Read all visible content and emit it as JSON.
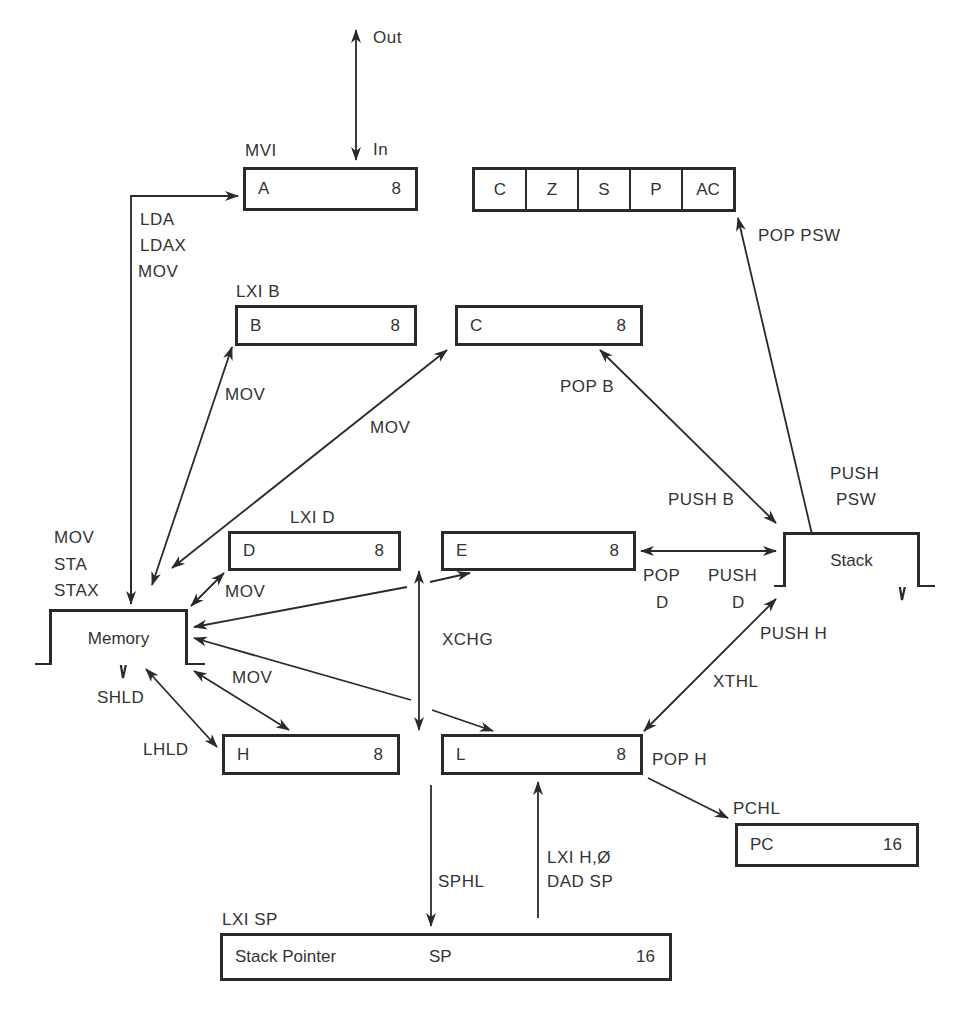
{
  "diagram": {
    "io": {
      "out_label": "Out",
      "in_label": "In"
    },
    "registers": {
      "A": {
        "name": "A",
        "bits": "8",
        "load_label": "MVI"
      },
      "B": {
        "name": "B",
        "bits": "8",
        "load_label": "LXI B"
      },
      "C": {
        "name": "C",
        "bits": "8"
      },
      "D": {
        "name": "D",
        "bits": "8",
        "load_label": "LXI D"
      },
      "E": {
        "name": "E",
        "bits": "8"
      },
      "H": {
        "name": "H",
        "bits": "8"
      },
      "L": {
        "name": "L",
        "bits": "8"
      },
      "PC": {
        "name": "PC",
        "bits": "16",
        "load_label": "PCHL"
      },
      "SP": {
        "name": "Stack Pointer",
        "short": "SP",
        "bits": "16",
        "load_label": "LXI SP"
      }
    },
    "flags": [
      "C",
      "Z",
      "S",
      "P",
      "AC"
    ],
    "stores": {
      "memory": "Memory",
      "stack": "Stack"
    },
    "edge_labels": {
      "mem_to_a": [
        "LDA",
        "LDAX",
        "MOV"
      ],
      "a_to_mem": [
        "MOV",
        "STA",
        "STAX"
      ],
      "mem_b": "MOV",
      "mem_c": "MOV",
      "mem_d": "MOV",
      "mem_h": "MOV",
      "shld": "SHLD",
      "lhld": "LHLD",
      "xchg": "XCHG",
      "pop_psw": "POP  PSW",
      "push_psw": [
        "PUSH",
        "PSW"
      ],
      "pop_b": "POP B",
      "push_b": "PUSH B",
      "pop_d": [
        "POP",
        "D"
      ],
      "push_d": [
        "PUSH",
        "D"
      ],
      "push_h": "PUSH H",
      "xthl": "XTHL",
      "pop_h": "POP H",
      "sphl": "SPHL",
      "lxi_dad": [
        "LXI H,Ø",
        "DAD SP"
      ]
    }
  }
}
